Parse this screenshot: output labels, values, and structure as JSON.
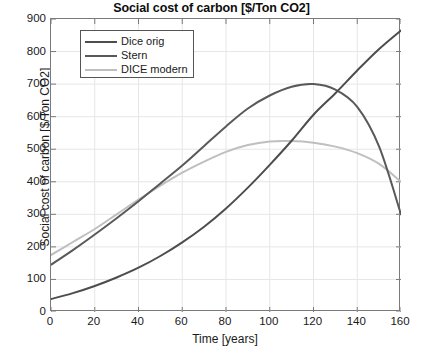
{
  "chart_data": {
    "type": "line",
    "title": "Social cost of carbon [$/Ton CO2]",
    "xlabel": "Time [years]",
    "ylabel": "Social cost of carbon [$/Ton CO2]",
    "xlim": [
      0,
      160
    ],
    "ylim": [
      0,
      900
    ],
    "xticks": [
      0,
      20,
      40,
      60,
      80,
      100,
      120,
      140,
      160
    ],
    "yticks": [
      0,
      100,
      200,
      300,
      400,
      500,
      600,
      700,
      800,
      900
    ],
    "grid": true,
    "legend_position": "upper left",
    "x": [
      0,
      10,
      20,
      30,
      40,
      50,
      60,
      70,
      80,
      90,
      100,
      110,
      120,
      130,
      140,
      150,
      160
    ],
    "series": [
      {
        "name": "Dice orig",
        "color": "#4d4d4d",
        "values": [
          40,
          58,
          80,
          106,
          136,
          172,
          214,
          262,
          318,
          382,
          452,
          526,
          606,
          672,
          742,
          808,
          865
        ]
      },
      {
        "name": "Stern",
        "color": "#595959",
        "values": [
          145,
          190,
          238,
          288,
          340,
          395,
          450,
          510,
          570,
          625,
          665,
          692,
          700,
          683,
          630,
          508,
          300
        ]
      },
      {
        "name": "DICE modern",
        "color": "#bfbfbf",
        "values": [
          175,
          215,
          255,
          300,
          345,
          388,
          428,
          462,
          492,
          513,
          524,
          525,
          520,
          508,
          488,
          455,
          400
        ]
      }
    ]
  },
  "legend": {
    "items": [
      {
        "label": "Dice orig"
      },
      {
        "label": "Stern"
      },
      {
        "label": "DICE modern"
      }
    ]
  },
  "axes": {
    "x_tick_labels": [
      "0",
      "20",
      "40",
      "60",
      "80",
      "100",
      "120",
      "140",
      "160"
    ],
    "y_tick_labels": [
      "0",
      "100",
      "200",
      "300",
      "400",
      "500",
      "600",
      "700",
      "800",
      "900"
    ]
  }
}
